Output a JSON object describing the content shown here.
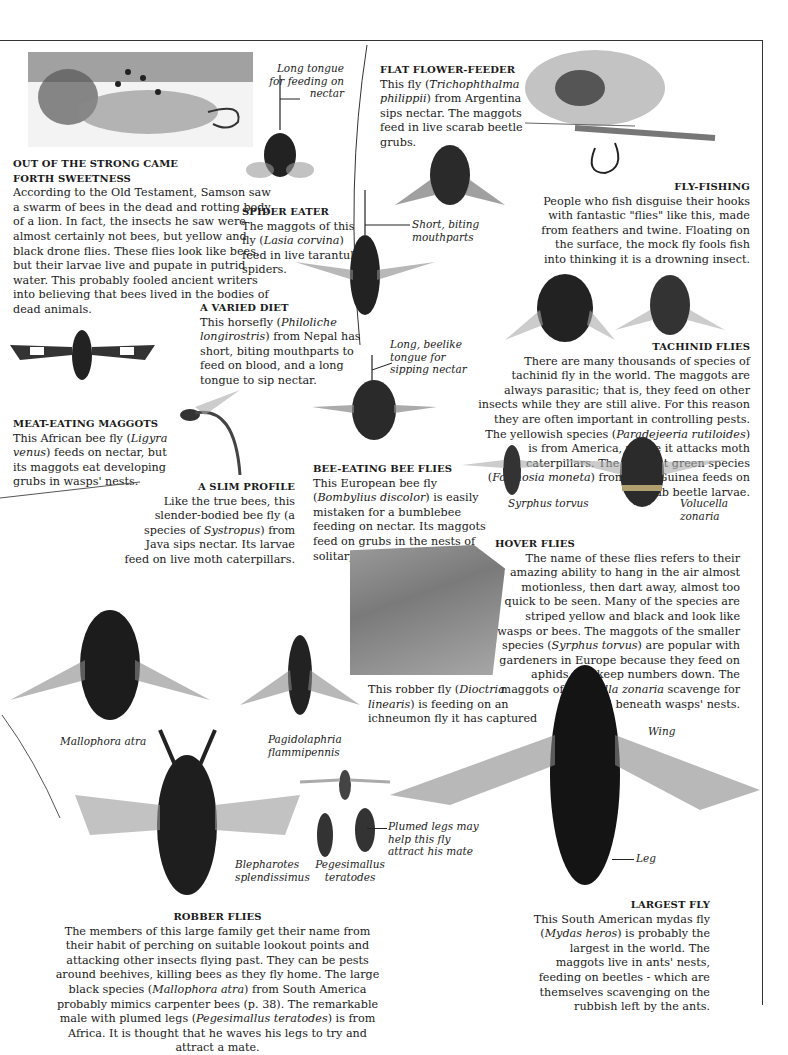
{
  "page": {
    "frame_color": "#333333",
    "text_color": "#1a1a1a"
  },
  "sections": {
    "samson": {
      "heading_line1": "OUT OF THE STRONG CAME",
      "heading_line2": "FORTH SWEETNESS",
      "body": "According to the Old Testament, Samson saw a swarm of bees in the dead and rotting body of a lion. In fact, the insects he saw were almost certainly not bees, but yellow and black drone flies. These flies look like bees, but their larvae live and pupate in putrid water. This probably fooled ancient writers into believing that bees lived in the bodies of dead animals."
    },
    "spider_eater": {
      "heading": "SPIDER EATER",
      "body_pre": "The maggots of this fly (",
      "species": "Lasia corvina",
      "body_post": ") feed in live tarantula spiders."
    },
    "flat_flower_feeder": {
      "heading": "FLAT FLOWER-FEEDER",
      "body_pre": "This fly (",
      "species": "Trichophthalma philippii",
      "body_post": ") from Argentina sips nectar. The maggots feed in live scarab beetle grubs."
    },
    "fly_fishing": {
      "heading": "FLY-FISHING",
      "body": "People who fish disguise their hooks with fantastic \"flies\" like this, made from feathers and twine. Floating on the surface, the mock fly fools fish into thinking it is a drowning insect."
    },
    "varied_diet": {
      "heading": "A VARIED DIET",
      "body_pre": "This horsefly (",
      "species": "Philoliche longirostris",
      "body_post": ") from Nepal has short, biting mouthparts to feed on blood, and a long tongue to sip nectar."
    },
    "tachinid": {
      "heading": "TACHINID FLIES",
      "body_1": "There are many thousands of species of tachinid fly in the world. The maggots are always parasitic; that is, they feed on other insects while they are still alive. For this reason they are often important in controlling pests. The yellowish species (",
      "species_1": "Paradejeeria rutiloides",
      "body_2": ") is from America, where it attacks moth caterpillars. The brilliant green species (",
      "species_2": "Formosia moneta",
      "body_3": ") from New Guinea feeds on scarab beetle larvae."
    },
    "meat_eating": {
      "heading": "MEAT-EATING MAGGOTS",
      "body_pre": "This African bee fly (",
      "species": "Ligyra venus",
      "body_post": ") feeds on nectar, but its maggots eat developing grubs in wasps' nests."
    },
    "slim_profile": {
      "heading": "A SLIM PROFILE",
      "body_pre": "Like the true bees, this slender-bodied bee fly (a species of ",
      "species": "Systropus",
      "body_post": ") from Java sips nectar. Its larvae feed on live moth caterpillars."
    },
    "bee_eating": {
      "heading": "BEE-EATING BEE FLIES",
      "body_pre": "This European bee fly (",
      "species": "Bombylius discolor",
      "body_post": ") is easily mistaken for a bumblebee feeding on nectar. Its maggots feed on grubs in the nests of solitary bees."
    },
    "hover": {
      "heading": "HOVER FLIES",
      "body_1": "The name of these flies refers to their amazing ability to hang in the air almost motionless, then dart away, almost too quick to be seen. Many of the species are striped yellow and black and look like wasps or bees. The maggots of the smaller species (",
      "species_1": "Syrphus torvus",
      "body_2": ") are popular with gardeners in Europe because they feed on aphids and keep numbers down. The maggots of ",
      "species_2": "Volucella zonaria",
      "body_3": " scavenge for food beneath wasps' nests."
    },
    "robber_photo": {
      "caption_pre": "This robber fly (",
      "species": "Dioctria linearis",
      "caption_post": ") is feeding on an ichneumon fly it has captured"
    },
    "robber": {
      "heading": "ROBBER FLIES",
      "body_1": "The members of this large family get their name from their habit of perching on suitable lookout points and attacking other insects flying past. They can be pests around beehives, killing bees as they fly home. The large black species (",
      "species_1": "Mallophora atra",
      "body_2": ") from South America probably mimics carpenter bees (p. 38). The remarkable male with plumed legs (",
      "species_2": "Pegesimallus teratodes",
      "body_3": ") is from Africa. It is thought that he waves his legs to try and attract a mate."
    },
    "largest": {
      "heading": "LARGEST FLY",
      "body_pre": "This South American mydas fly (",
      "species": "Mydas heros",
      "body_post": ") is probably the largest in the world. The maggots live in ants' nests, feeding on beetles - which are themselves scavenging on the rubbish left by the ants."
    }
  },
  "annotations": {
    "long_tongue": "Long tongue for feeding on nectar",
    "short_biting": "Short, biting mouthparts",
    "long_beelike": "Long, beelike tongue for sipping nectar",
    "plumed_legs": "Plumed legs may help this fly attract his mate",
    "wing": "Wing",
    "leg": "Leg"
  },
  "species_labels": {
    "syrphus": "Syrphus torvus",
    "volucella": "Volucella zonaria",
    "mallophora": "Mallophora atra",
    "pagidolaphria": "Pagidolaphria flammipennis",
    "blepharotes": "Blepharotes splendissimus",
    "pegesimallus": "Pegesimallus teratodes"
  }
}
